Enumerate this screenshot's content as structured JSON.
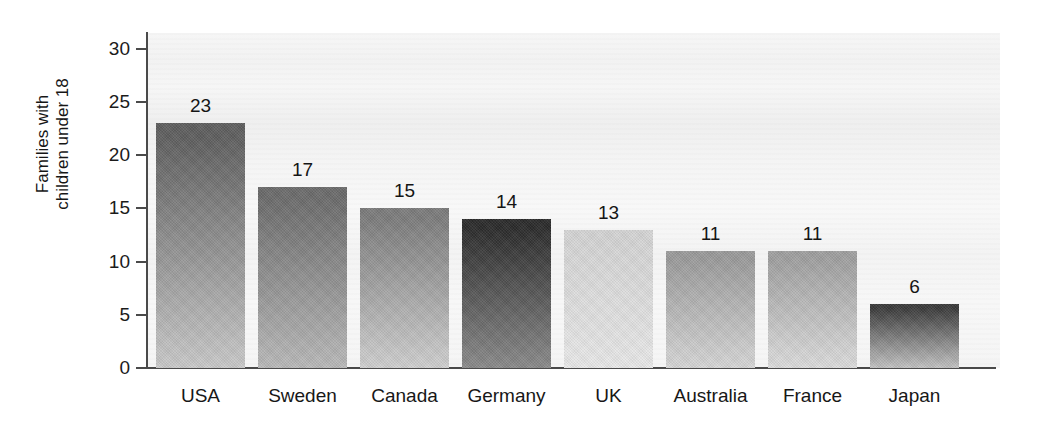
{
  "chart_data": {
    "type": "bar",
    "title": "",
    "subtitle": "",
    "xlabel": "",
    "ylabel": "Families with\nchildren under 18",
    "ylabel_line1": "Families with",
    "ylabel_line2": "children under 18",
    "categories": [
      "USA",
      "Sweden",
      "Canada",
      "Germany",
      "UK",
      "Australia",
      "France",
      "Japan"
    ],
    "values": [
      23,
      17,
      15,
      14,
      13,
      11,
      11,
      6
    ],
    "value_labels": [
      "23",
      "17",
      "15",
      "14",
      "13",
      "11",
      "11",
      "6"
    ],
    "ylim": [
      0,
      31.5
    ],
    "yticks": [
      0,
      5,
      10,
      15,
      20,
      25,
      30
    ],
    "ytick_labels": [
      "0",
      "5",
      "10",
      "15",
      "20",
      "25",
      "30"
    ],
    "grid": false,
    "legend": null,
    "legend_position": "none",
    "bar_fill_style": "vertical gradient, dark at top to light at bottom",
    "bar_colors_top": [
      "#5f5f5f",
      "#6b6b6b",
      "#7c7c7c",
      "#2b2b2b",
      "#d4d4d4",
      "#9a9a9a",
      "#9f9f9f",
      "#3a3a3a"
    ],
    "bar_colors_bottom": [
      "#c9c9c9",
      "#b9b9b9",
      "#cfcfcf",
      "#8a8a8a",
      "#e8e8e8",
      "#d6d6d6",
      "#dcdcdc",
      "#c2c2c2"
    ],
    "axis_color": "#4a4a4a",
    "panel_color": "#f5f5f5",
    "text_color": "#1b1b1b",
    "bars": [
      {
        "category": "USA",
        "value": 23,
        "label": "23",
        "color_top": "#5f5f5f",
        "color_bottom": "#c9c9c9"
      },
      {
        "category": "Sweden",
        "value": 17,
        "label": "17",
        "color_top": "#6b6b6b",
        "color_bottom": "#b9b9b9"
      },
      {
        "category": "Canada",
        "value": 15,
        "label": "15",
        "color_top": "#7c7c7c",
        "color_bottom": "#cfcfcf"
      },
      {
        "category": "Germany",
        "value": 14,
        "label": "14",
        "color_top": "#2b2b2b",
        "color_bottom": "#8a8a8a"
      },
      {
        "category": "UK",
        "value": 13,
        "label": "13",
        "color_top": "#d4d4d4",
        "color_bottom": "#e8e8e8"
      },
      {
        "category": "Australia",
        "value": 11,
        "label": "11",
        "color_top": "#9a9a9a",
        "color_bottom": "#d6d6d6"
      },
      {
        "category": "France",
        "value": 11,
        "label": "11",
        "color_top": "#9f9f9f",
        "color_bottom": "#dcdcdc"
      },
      {
        "category": "Japan",
        "value": 6,
        "label": "6",
        "color_top": "#3a3a3a",
        "color_bottom": "#c2c2c2"
      }
    ]
  }
}
